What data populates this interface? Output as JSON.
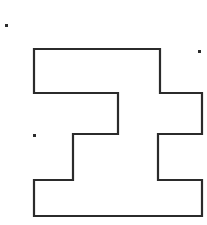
{
  "canvas": {
    "width": 207,
    "height": 225,
    "background_color": "#ffffff"
  },
  "figure": {
    "name": "orthogonal-polygon",
    "stroke_color": "#2b2b2b",
    "fill_color": "#ffffff",
    "stroke_width": 2.2,
    "points": "34,49 160,49 160,93 202,93 202,134 158,134 158,180 202,180 202,216 34,216 34,180 73,180 73,134 118,134 118,93 34,93",
    "vertices": [
      [
        34,
        49
      ],
      [
        160,
        49
      ],
      [
        160,
        93
      ],
      [
        202,
        93
      ],
      [
        202,
        134
      ],
      [
        158,
        134
      ],
      [
        158,
        180
      ],
      [
        202,
        180
      ],
      [
        202,
        216
      ],
      [
        34,
        216
      ],
      [
        34,
        180
      ],
      [
        73,
        180
      ],
      [
        73,
        134
      ],
      [
        118,
        134
      ],
      [
        118,
        93
      ],
      [
        34,
        93
      ]
    ]
  },
  "specks": [
    {
      "name": "speck-top-left",
      "x": 5,
      "y": 24,
      "size": 3,
      "color": "#2b2b2b"
    },
    {
      "name": "speck-top-right",
      "x": 198,
      "y": 50,
      "size": 3,
      "color": "#2b2b2b"
    },
    {
      "name": "speck-mid-left",
      "x": 33,
      "y": 134,
      "size": 3,
      "color": "#2b2b2b"
    }
  ]
}
